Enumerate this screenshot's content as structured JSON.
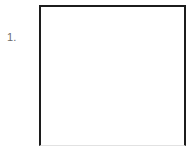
{
  "page": {
    "background_color": "#ffffff",
    "width": 194,
    "height": 153
  },
  "worksheet_item": {
    "number_label": "1.",
    "number_color": "#6b6b6b",
    "answer_box": {
      "content": "",
      "fill_color": "#ffffff",
      "border_color": "#1c1c1c",
      "bottom_border_color": "#e2e2e2"
    }
  }
}
